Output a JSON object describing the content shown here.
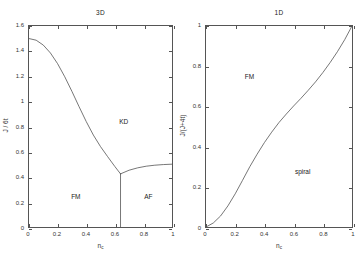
{
  "figure": {
    "width": 360,
    "height": 260,
    "background": "#ffffff",
    "line_color": "#4a4a4a",
    "axis_color": "#555555"
  },
  "chart_data": [
    {
      "type": "line",
      "id": "panel-3d",
      "title": "3D",
      "xlabel": "n_c",
      "xlabel_base": "n",
      "xlabel_sub": "c",
      "ylabel": "J / 6t",
      "xlim": [
        0,
        1
      ],
      "ylim": [
        0,
        1.6
      ],
      "xticks": [
        0,
        0.2,
        0.4,
        0.6,
        0.8,
        1
      ],
      "xticklabels": [
        "0",
        "0.2",
        "0.4",
        "0.6",
        "0.8",
        "1"
      ],
      "yticks": [
        0,
        0.2,
        0.4,
        0.6,
        0.8,
        1,
        1.2,
        1.4,
        1.6
      ],
      "yticklabels": [
        "0",
        "0.2",
        "0.4",
        "0.6",
        "0.8",
        "1",
        "1.2",
        "1.4",
        "1.6"
      ],
      "grid": false,
      "legend": null,
      "annotations": [
        {
          "text": "KD",
          "x": 0.66,
          "y": 0.84
        },
        {
          "text": "FM",
          "x": 0.33,
          "y": 0.25
        },
        {
          "text": "AF",
          "x": 0.83,
          "y": 0.25
        }
      ],
      "series": [
        {
          "name": "FM-KD phase boundary",
          "x": [
            0.0,
            0.05,
            0.1,
            0.15,
            0.2,
            0.25,
            0.3,
            0.35,
            0.4,
            0.45,
            0.5,
            0.55,
            0.6,
            0.64
          ],
          "y": [
            1.5,
            1.487,
            1.448,
            1.385,
            1.3,
            1.196,
            1.08,
            0.958,
            0.84,
            0.732,
            0.64,
            0.56,
            0.482,
            0.423
          ]
        },
        {
          "name": "KD-AF phase boundary",
          "x": [
            0.64,
            0.7,
            0.76,
            0.82,
            0.88,
            0.94,
            1.0
          ],
          "y": [
            0.423,
            0.452,
            0.471,
            0.484,
            0.492,
            0.497,
            0.5
          ]
        },
        {
          "name": "FM-AF vertical boundary",
          "x": [
            0.64,
            0.64
          ],
          "y": [
            0.0,
            0.423
          ]
        }
      ]
    },
    {
      "type": "line",
      "id": "panel-1d",
      "title": "1D",
      "xlabel": "n_c",
      "xlabel_base": "n",
      "xlabel_sub": "c",
      "ylabel": "J/(J+4t)",
      "xlim": [
        0,
        1
      ],
      "ylim": [
        0,
        1
      ],
      "xticks": [
        0,
        0.2,
        0.4,
        0.6,
        0.8,
        1
      ],
      "xticklabels": [
        "0",
        "0.2",
        "0.4",
        "0.6",
        "0.8",
        "1"
      ],
      "yticks": [
        0,
        0.2,
        0.4,
        0.6,
        0.8,
        1
      ],
      "yticklabels": [
        "0",
        "0.2",
        "0.4",
        "0.6",
        "0.8",
        "1"
      ],
      "grid": false,
      "legend": null,
      "annotations": [
        {
          "text": "FM",
          "x": 0.3,
          "y": 0.75
        },
        {
          "text": "spiral",
          "x": 0.66,
          "y": 0.28
        }
      ],
      "series": [
        {
          "name": "FM-spiral phase boundary",
          "x": [
            0.0,
            0.05,
            0.1,
            0.15,
            0.2,
            0.25,
            0.3,
            0.35,
            0.4,
            0.45,
            0.5,
            0.55,
            0.6,
            0.65,
            0.7,
            0.75,
            0.8,
            0.85,
            0.9,
            0.95,
            1.0
          ],
          "y": [
            0.0,
            0.02,
            0.055,
            0.105,
            0.165,
            0.232,
            0.3,
            0.362,
            0.42,
            0.472,
            0.52,
            0.562,
            0.602,
            0.64,
            0.68,
            0.722,
            0.768,
            0.818,
            0.872,
            0.932,
            1.0
          ]
        }
      ]
    }
  ]
}
